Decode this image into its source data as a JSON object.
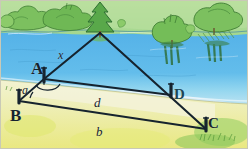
{
  "figure": {
    "medium": "hand-drawn watercolor sketch",
    "size": {
      "width": 248,
      "height": 149
    }
  },
  "scene": {
    "sky_and_far_bank": {
      "name": "far-bank-treeline",
      "color": "#9fd08a",
      "description": "band of bushes and trees along the far shore"
    },
    "water": {
      "name": "river-water",
      "color": "#5ab4e6",
      "haze_color": "#9fd8ef",
      "description": "blue river surface with dark green tree reflections"
    },
    "near_bank": {
      "name": "near-bank-ground",
      "color": "#eef2c8",
      "grass_color": "#edea8a",
      "description": "pale yellow-green foreground field"
    },
    "trees": [
      {
        "name": "apex-tree",
        "x": 100,
        "y": 18,
        "color": "#59a84a",
        "trunk": "#8a6a3a"
      },
      {
        "name": "far-tree-left-cluster",
        "x": 35,
        "y": 16,
        "color": "#7cc05f"
      },
      {
        "name": "far-tree-mid-cluster",
        "x": 65,
        "y": 14,
        "color": "#6fb855"
      },
      {
        "name": "far-tree-right-a",
        "x": 172,
        "y": 22,
        "color": "#74bd58"
      },
      {
        "name": "far-tree-right-b",
        "x": 212,
        "y": 16,
        "color": "#7cc05f"
      }
    ],
    "reflections": [
      {
        "name": "reflection-right-a",
        "x": 172,
        "y": 46
      },
      {
        "name": "reflection-right-b",
        "x": 212,
        "y": 44
      }
    ]
  },
  "survey": {
    "points": [
      {
        "id": "T",
        "name": "tree-apex-point",
        "label": "",
        "x": 100,
        "y": 32,
        "stake": false
      },
      {
        "id": "A",
        "name": "point-a",
        "label": "A",
        "x": 44,
        "y": 79,
        "stake": true
      },
      {
        "id": "B",
        "name": "point-b",
        "label": "B",
        "x": 19,
        "y": 101,
        "stake": true
      },
      {
        "id": "D",
        "name": "point-d",
        "label": "D",
        "x": 170,
        "y": 94,
        "stake": true
      },
      {
        "id": "C",
        "name": "point-c",
        "label": "C",
        "x": 206,
        "y": 129,
        "stake": true
      }
    ],
    "segments": [
      {
        "name": "segment-x",
        "label": "x",
        "from": "A",
        "to": "T",
        "label_x": 58,
        "label_y": 49
      },
      {
        "name": "segment-tc",
        "label": "",
        "from": "T",
        "to": "C",
        "label_x": 0,
        "label_y": 0
      },
      {
        "name": "segment-d",
        "label": "d",
        "from": "A",
        "to": "D",
        "label_x": 94,
        "label_y": 96
      },
      {
        "name": "segment-b",
        "label": "b",
        "from": "B",
        "to": "C",
        "label_x": 96,
        "label_y": 125
      },
      {
        "name": "segment-a",
        "label": "a",
        "from": "B",
        "to": "A",
        "label_x": 22,
        "label_y": 84
      }
    ],
    "angles": [
      {
        "name": "angle-alpha",
        "label": "a",
        "vertex": "B",
        "x": 27,
        "y": 89
      },
      {
        "name": "angle-at-a",
        "label": "",
        "vertex": "A",
        "x": 46,
        "y": 86
      }
    ],
    "labels": {
      "A": "A",
      "B": "B",
      "C": "C",
      "D": "D",
      "x": "x",
      "a": "a",
      "d": "d",
      "b": "b",
      "alpha": "a"
    }
  },
  "colors": {
    "ink": "#16232e",
    "water": "#5ab4e6",
    "foliage": "#6fb855",
    "ground": "#edea8a",
    "sand": "#e7e6c0"
  }
}
